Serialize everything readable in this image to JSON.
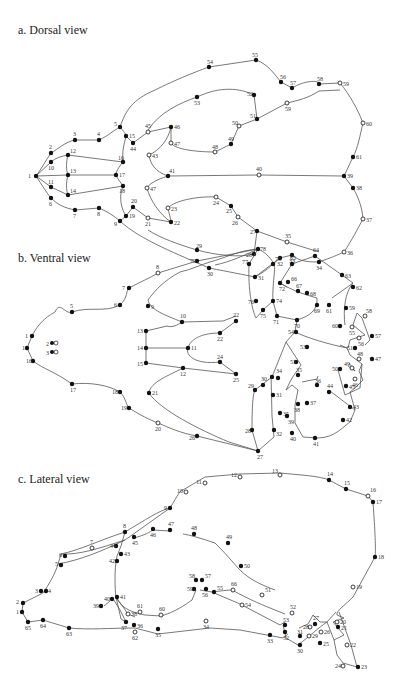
{
  "panels": [
    {
      "id": "dorsal",
      "title": "a. Dorsal view",
      "title_pos": [
        18,
        10
      ],
      "landmarks": [
        {
          "n": "1",
          "x": 36,
          "y": 66,
          "t": "f"
        },
        {
          "n": "2",
          "x": 51,
          "y": 43,
          "t": "f"
        },
        {
          "n": "3",
          "x": 75,
          "y": 30,
          "t": "f"
        },
        {
          "n": "4",
          "x": 99,
          "y": 30,
          "t": "f"
        },
        {
          "n": "5",
          "x": 120,
          "y": 17,
          "t": "f"
        },
        {
          "n": "6",
          "x": 51,
          "y": 88,
          "t": "f"
        },
        {
          "n": "7",
          "x": 75,
          "y": 100,
          "t": "f"
        },
        {
          "n": "8",
          "x": 99,
          "y": 98,
          "t": "f"
        },
        {
          "n": "9",
          "x": 120,
          "y": 111,
          "t": "f"
        },
        {
          "n": "10",
          "x": 51,
          "y": 52,
          "t": "f"
        },
        {
          "n": "11",
          "x": 51,
          "y": 77,
          "t": "f"
        },
        {
          "n": "12",
          "x": 68,
          "y": 45,
          "t": "f"
        },
        {
          "n": "13",
          "x": 68,
          "y": 65,
          "t": "f"
        },
        {
          "n": "14",
          "x": 68,
          "y": 85,
          "t": "f"
        },
        {
          "n": "16",
          "x": 123,
          "y": 52,
          "t": "f"
        },
        {
          "n": "17",
          "x": 116,
          "y": 65,
          "t": "f"
        },
        {
          "n": "18",
          "x": 123,
          "y": 76,
          "t": "f"
        },
        {
          "n": "19",
          "x": 126,
          "y": 106,
          "t": "f"
        },
        {
          "n": "20",
          "x": 133,
          "y": 97,
          "t": "f"
        },
        {
          "n": "21",
          "x": 148,
          "y": 108,
          "t": "o"
        },
        {
          "n": "22",
          "x": 171,
          "y": 112,
          "t": "f"
        },
        {
          "n": "23",
          "x": 168,
          "y": 98,
          "t": "o"
        },
        {
          "n": "24",
          "x": 216,
          "y": 87,
          "t": "o"
        },
        {
          "n": "25",
          "x": 231,
          "y": 96,
          "t": "f"
        },
        {
          "n": "26",
          "x": 238,
          "y": 107,
          "t": "o"
        },
        {
          "n": "27",
          "x": 257,
          "y": 121,
          "t": "f"
        },
        {
          "n": "28",
          "x": 254,
          "y": 144,
          "t": "f"
        },
        {
          "n": "29",
          "x": 197,
          "y": 140,
          "t": "f"
        },
        {
          "n": "30",
          "x": 209,
          "y": 158,
          "t": "f"
        },
        {
          "n": "31",
          "x": 255,
          "y": 167,
          "t": "f"
        },
        {
          "n": "32",
          "x": 280,
          "y": 148,
          "t": "f"
        },
        {
          "n": "33",
          "x": 292,
          "y": 145,
          "t": "f"
        },
        {
          "n": "34",
          "x": 319,
          "y": 152,
          "t": "f"
        },
        {
          "n": "35",
          "x": 287,
          "y": 132,
          "t": "o"
        },
        {
          "n": "36",
          "x": 344,
          "y": 142,
          "t": "o"
        },
        {
          "n": "37",
          "x": 363,
          "y": 109,
          "t": "o"
        },
        {
          "n": "38",
          "x": 353,
          "y": 78,
          "t": "f"
        },
        {
          "n": "39",
          "x": 344,
          "y": 66,
          "t": "f"
        },
        {
          "n": "40",
          "x": 259,
          "y": 65,
          "t": "o"
        },
        {
          "n": "41",
          "x": 168,
          "y": 66,
          "t": "f"
        },
        {
          "n": "43",
          "x": 149,
          "y": 45,
          "t": "o"
        },
        {
          "n": "44",
          "x": 133,
          "y": 33,
          "t": "f"
        },
        {
          "n": "45",
          "x": 148,
          "y": 22,
          "t": "o"
        },
        {
          "n": "46",
          "x": 171,
          "y": 17,
          "t": "f"
        },
        {
          "n": "47",
          "x": 171,
          "y": 33,
          "t": "o"
        },
        {
          "n": "47b",
          "label": "47",
          "x": 147,
          "y": 78,
          "t": "o"
        },
        {
          "n": "48",
          "x": 215,
          "y": 42,
          "t": "o"
        },
        {
          "n": "49",
          "x": 231,
          "y": 34,
          "t": "f"
        },
        {
          "n": "50",
          "x": 239,
          "y": 16,
          "t": "o"
        },
        {
          "n": "51",
          "x": 257,
          "y": 9,
          "t": "f"
        },
        {
          "n": "52",
          "x": 254,
          "y": -15,
          "t": "f"
        },
        {
          "n": "53",
          "x": 197,
          "y": -13,
          "t": "f"
        },
        {
          "n": "54",
          "x": 209,
          "y": -33,
          "t": "f"
        },
        {
          "n": "55",
          "x": 255,
          "y": -38,
          "t": "f"
        },
        {
          "n": "56",
          "x": 280,
          "y": -21,
          "t": "f"
        },
        {
          "n": "57",
          "x": 292,
          "y": -18,
          "t": "f"
        },
        {
          "n": "58",
          "x": 319,
          "y": -19,
          "t": "f"
        },
        {
          "n": "59",
          "x": 287,
          "y": -7,
          "t": "o"
        },
        {
          "n": "59b",
          "label": "59",
          "x": 340,
          "y": -20,
          "t": "o"
        },
        {
          "n": "60",
          "x": 363,
          "y": 13,
          "t": "o"
        },
        {
          "n": "61",
          "x": 353,
          "y": 47,
          "t": "f"
        },
        {
          "n": "15",
          "x": 126,
          "y": 26,
          "t": "f"
        }
      ]
    },
    {
      "id": "ventral",
      "title": "b. Ventral view",
      "title_pos": [
        18,
        255
      ]
    },
    {
      "id": "lateral",
      "title": "c. Lateral view",
      "title_pos": [
        18,
        472
      ]
    }
  ]
}
